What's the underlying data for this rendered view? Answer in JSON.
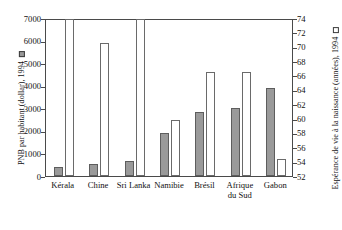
{
  "chart_data": {
    "type": "bar",
    "title": "",
    "subtitle": "",
    "categories": [
      "Kérala",
      "Chine",
      "Sri Lanka",
      "Namibie",
      "Brésil",
      "Afrique\ndu Sud",
      "Gabon"
    ],
    "series": [
      {
        "name": "PNB par habitant (dollar), 1994",
        "axis": "left",
        "style": "filled-gray",
        "color": "#9a9a9a",
        "values": [
          400,
          550,
          650,
          1900,
          2850,
          3000,
          3900
        ]
      },
      {
        "name": "Espérance de vie à la naissance (années), 1994",
        "axis": "right",
        "style": "hollow-white",
        "color": "#ffffff",
        "values": [
          73.8,
          70.5,
          73.9,
          59.8,
          66.5,
          66.5,
          54.3
        ]
      }
    ],
    "ylabel": "PNB par habitant (dollar), 1994",
    "ylabel_right": "Espérance de vie à la naissance (années), 1994",
    "xlabel": "",
    "ylim": [
      0,
      7000
    ],
    "ylim_right": [
      52,
      74
    ],
    "yticks": [
      0,
      1000,
      2000,
      3000,
      4000,
      5000,
      6000,
      7000
    ],
    "yticks_right": [
      52,
      54,
      56,
      58,
      60,
      62,
      64,
      66,
      68,
      70,
      72,
      74
    ],
    "ytick_labels": [
      "0",
      "1000",
      "2000",
      "3000",
      "4000",
      "5000",
      "6000",
      "7000"
    ],
    "ytick_labels_right": [
      "52",
      "54",
      "56",
      "58",
      "60",
      "62",
      "64",
      "66",
      "68",
      "70",
      "72",
      "74"
    ],
    "grid": false,
    "legend_position": "axis-titles"
  },
  "axes": {
    "left_title": "PNB par habitant (dollar), 1994",
    "right_title": "Espérance de vie à la naissance (années), 1994"
  }
}
